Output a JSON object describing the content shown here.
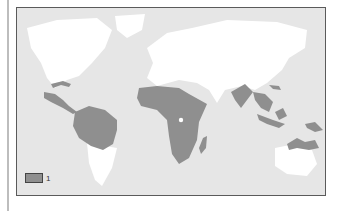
{
  "map": {
    "type": "world distribution map",
    "projection": "equirectangular-like",
    "colors": {
      "ocean": "#e6e6e6",
      "land": "#ffffff",
      "highlight": "#8f8f8f",
      "frame": "#5a5a5a"
    },
    "highlighted_regions": [
      "Central America",
      "Caribbean (Cuba)",
      "Northern South America (Amazon basin)",
      "Sub-Saharan Africa",
      "Madagascar",
      "India",
      "Southeast Asia",
      "Taiwan / southern China coast",
      "Indonesia / Philippines",
      "New Guinea",
      "Northern Australia"
    ]
  },
  "legend": {
    "items": [
      {
        "swatch_color": "#8f8f8f",
        "label": "1"
      }
    ]
  }
}
